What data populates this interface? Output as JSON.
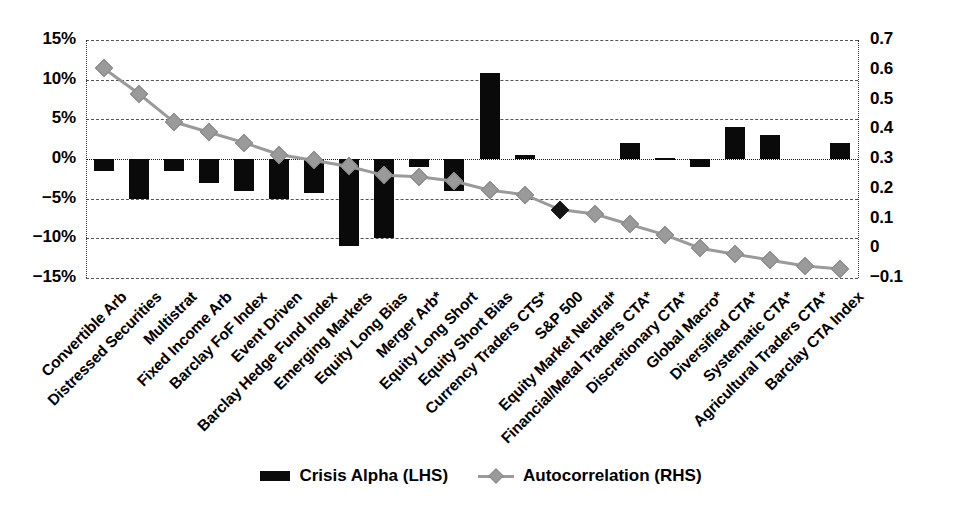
{
  "chart_data": {
    "type": "bar",
    "title": "",
    "subtitle": "",
    "xlabel": "",
    "ylabel": "",
    "y2label": "",
    "grid": true,
    "legend_position": "bottom",
    "categories": [
      "Convertible Arb",
      "Distressed Securities",
      "Multistrat",
      "Fixed Income Arb",
      "Barclay FoF Index",
      "Event Driven",
      "Barclay Hedge Fund Index",
      "Emerging Markets",
      "Equity Long Bias",
      "Merger Arb*",
      "Equity Long Short",
      "Equity Short Bias",
      "Currency Traders CTS*",
      "S&P 500",
      "Equity Market Neutral*",
      "Financial/Metal Traders CTA*",
      "Discretionary CTA*",
      "Global Macro*",
      "Diversified CTA*",
      "Systematic CTA*",
      "Agricultural Traders CTA*",
      "Barclay CTA Index"
    ],
    "series": [
      {
        "name": "Crisis Alpha (LHS)",
        "type": "bar",
        "axis": "left",
        "color": "#0a0a0a",
        "unit": "%",
        "values": [
          -1.5,
          -5.0,
          -1.5,
          -3.0,
          -4.0,
          -5.0,
          -4.3,
          -11.0,
          -10.0,
          -1.0,
          -4.0,
          10.8,
          0.5,
          0,
          0,
          2.0,
          0.1,
          -1.0,
          4.0,
          3.0,
          0,
          2.0
        ]
      },
      {
        "name": "Autocorrelation (RHS)",
        "type": "line",
        "axis": "right",
        "color": "#9a9a9a",
        "marker": "diamond",
        "values": [
          0.605,
          0.52,
          0.425,
          0.39,
          0.355,
          0.315,
          0.295,
          0.275,
          0.245,
          0.24,
          0.225,
          0.195,
          0.18,
          0.13,
          0.115,
          0.08,
          0.045,
          0.0,
          -0.02,
          -0.04,
          -0.06,
          -0.07
        ],
        "highlight_points": [
          {
            "index": 13,
            "label": "S&P 500",
            "color": "#151515"
          }
        ]
      }
    ],
    "left_axis": {
      "ticks": [
        "15%",
        "10%",
        "5%",
        "0%",
        "-5%",
        "-10%",
        "-15%"
      ],
      "values": [
        15,
        10,
        5,
        0,
        -5,
        -10,
        -15
      ],
      "min": -15,
      "max": 15
    },
    "right_axis": {
      "ticks": [
        "0.7",
        "0.6",
        "0.5",
        "0.4",
        "0.3",
        "0.2",
        "0.1",
        "0",
        "-0.1"
      ],
      "values": [
        0.7,
        0.6,
        0.5,
        0.4,
        0.3,
        0.2,
        0.1,
        0,
        -0.1
      ],
      "min": -0.1,
      "max": 0.7
    },
    "legend": [
      {
        "label": "Crisis Alpha (LHS)",
        "swatch": "bar",
        "color": "#0a0a0a"
      },
      {
        "label": "Autocorrelation (RHS)",
        "swatch": "line-diamond",
        "color": "#9a9a9a"
      }
    ]
  }
}
